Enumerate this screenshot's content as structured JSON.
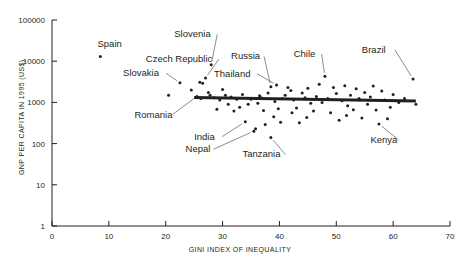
{
  "chart_data": {
    "type": "scatter",
    "title": "",
    "xlabel": "GINI INDEX OF INEQUALITY",
    "ylabel": "GNP PER CAPITA IN 1995 (US$)",
    "xlim": [
      0,
      70
    ],
    "ylim": [
      1,
      100000
    ],
    "yscale": "log",
    "grid": false,
    "legend": null,
    "xticks": [
      0,
      10,
      20,
      30,
      40,
      50,
      60,
      70
    ],
    "xtick_labels": [
      "0",
      "10",
      "20",
      "30",
      "40",
      "50",
      "60",
      "70"
    ],
    "yticks": [
      1,
      10,
      100,
      1000,
      10000,
      100000
    ],
    "ytick_labels": [
      "1",
      "10",
      "100",
      "1000",
      "10000",
      "100000"
    ],
    "trendline": {
      "x_start": 25.0,
      "x_end": 64.0,
      "y_start": 1320,
      "y_end": 1080,
      "description": "slightly downward sloping fitted line"
    },
    "annotations": [
      {
        "label": "Spain",
        "x": 8.5,
        "y": 13000,
        "label_x": 8.0,
        "label_y": 22000,
        "leader": false
      },
      {
        "label": "Slovenia",
        "x": 28.0,
        "y": 8200,
        "label_x": 21.5,
        "label_y": 38000,
        "leader": true
      },
      {
        "label": "Czech Republic",
        "x": 27.0,
        "y": 3900,
        "label_x": 16.5,
        "label_y": 9500,
        "leader": true
      },
      {
        "label": "Slovakia",
        "x": 22.5,
        "y": 3000,
        "label_x": 12.5,
        "label_y": 4300,
        "leader": true
      },
      {
        "label": "Romania",
        "x": 25.5,
        "y": 1400,
        "label_x": 14.5,
        "label_y": 430,
        "leader": true
      },
      {
        "label": "Russia",
        "x": 38.5,
        "y": 2400,
        "label_x": 31.5,
        "label_y": 11000,
        "leader": true
      },
      {
        "label": "Thailand",
        "x": 39.5,
        "y": 2650,
        "label_x": 28.5,
        "label_y": 4200,
        "leader": true
      },
      {
        "label": "Chile",
        "x": 48.0,
        "y": 4300,
        "label_x": 42.5,
        "label_y": 12500,
        "leader": true
      },
      {
        "label": "Brazil",
        "x": 63.5,
        "y": 3700,
        "label_x": 54.5,
        "label_y": 16000,
        "leader": true
      },
      {
        "label": "India",
        "x": 34.0,
        "y": 340,
        "label_x": 25.0,
        "label_y": 125,
        "leader": true
      },
      {
        "label": "Nepal",
        "x": 35.5,
        "y": 200,
        "label_x": 23.5,
        "label_y": 62,
        "leader": true
      },
      {
        "label": "Tanzania",
        "x": 38.5,
        "y": 140,
        "label_x": 33.5,
        "label_y": 46,
        "leader": true
      },
      {
        "label": "Kenya",
        "x": 57.5,
        "y": 300,
        "label_x": 56.0,
        "label_y": 105,
        "leader": true
      }
    ],
    "points": [
      [
        8.5,
        13000
      ],
      [
        22.5,
        3000
      ],
      [
        20.5,
        1500
      ],
      [
        24.5,
        2000
      ],
      [
        26.0,
        3100
      ],
      [
        26.5,
        2900
      ],
      [
        27.0,
        3900
      ],
      [
        28.0,
        8200
      ],
      [
        27.5,
        1750
      ],
      [
        27.8,
        1500
      ],
      [
        25.5,
        1400
      ],
      [
        26.2,
        1250
      ],
      [
        28.5,
        1300
      ],
      [
        29.5,
        1150
      ],
      [
        30.5,
        1500
      ],
      [
        31.5,
        1350
      ],
      [
        31.0,
        900
      ],
      [
        32.5,
        1200
      ],
      [
        33.0,
        760
      ],
      [
        32.0,
        620
      ],
      [
        34.0,
        340
      ],
      [
        35.0,
        1200
      ],
      [
        35.5,
        200
      ],
      [
        35.8,
        230
      ],
      [
        36.2,
        950
      ],
      [
        36.5,
        1450
      ],
      [
        36.8,
        1300
      ],
      [
        37.2,
        640
      ],
      [
        37.5,
        290
      ],
      [
        38.0,
        1700
      ],
      [
        38.5,
        2400
      ],
      [
        38.5,
        140
      ],
      [
        39.5,
        2650
      ],
      [
        39.2,
        1050
      ],
      [
        39.8,
        700
      ],
      [
        40.5,
        1250
      ],
      [
        40.2,
        330
      ],
      [
        41.0,
        1500
      ],
      [
        41.5,
        2300
      ],
      [
        42.0,
        1950
      ],
      [
        42.5,
        1150
      ],
      [
        42.2,
        560
      ],
      [
        43.0,
        730
      ],
      [
        43.5,
        320
      ],
      [
        44.0,
        1700
      ],
      [
        44.5,
        1300
      ],
      [
        45.0,
        2200
      ],
      [
        45.5,
        950
      ],
      [
        46.0,
        620
      ],
      [
        46.5,
        1400
      ],
      [
        47.0,
        2750
      ],
      [
        48.0,
        4300
      ],
      [
        48.5,
        1250
      ],
      [
        49.0,
        560
      ],
      [
        49.5,
        2300
      ],
      [
        50.0,
        1650
      ],
      [
        50.5,
        370
      ],
      [
        51.0,
        1100
      ],
      [
        51.5,
        2550
      ],
      [
        52.0,
        830
      ],
      [
        52.5,
        1500
      ],
      [
        53.0,
        660
      ],
      [
        53.5,
        2150
      ],
      [
        54.0,
        1250
      ],
      [
        54.5,
        420
      ],
      [
        55.0,
        1750
      ],
      [
        55.5,
        900
      ],
      [
        56.0,
        1350
      ],
      [
        56.5,
        2500
      ],
      [
        57.0,
        650
      ],
      [
        57.5,
        300
      ],
      [
        58.0,
        1900
      ],
      [
        58.5,
        1150
      ],
      [
        59.0,
        400
      ],
      [
        59.5,
        760
      ],
      [
        60.0,
        1550
      ],
      [
        61.0,
        1000
      ],
      [
        62.0,
        1250
      ],
      [
        63.5,
        3700
      ],
      [
        64.0,
        900
      ],
      [
        30.0,
        2050
      ],
      [
        33.5,
        1550
      ],
      [
        34.5,
        900
      ],
      [
        47.5,
        1000
      ],
      [
        29.0,
        680
      ],
      [
        44.8,
        430
      ],
      [
        51.8,
        480
      ],
      [
        39.0,
        450
      ]
    ]
  },
  "axes": {
    "y_axis_title": "GNP PER CAPITA IN 1995 (US$)",
    "x_axis_title": "GINI INDEX OF INEQUALITY"
  }
}
